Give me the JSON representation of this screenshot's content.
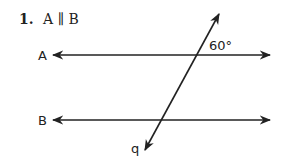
{
  "problem": {
    "number": "1.",
    "statement": "A ∥ B"
  },
  "diagram": {
    "line_a_label": "A",
    "line_b_label": "B",
    "transversal_label": "q",
    "angle_label": "60°",
    "stroke_color": "#222222"
  }
}
